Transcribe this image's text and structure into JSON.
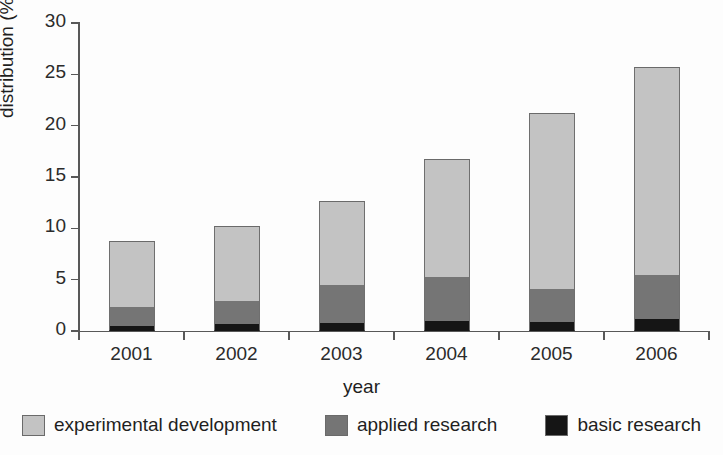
{
  "chart_data": {
    "type": "bar",
    "subtype": "stacked-bar",
    "title": "",
    "xlabel": "year",
    "ylabel": "distribution (%)",
    "categories": [
      "2001",
      "2002",
      "2003",
      "2004",
      "2005",
      "2006"
    ],
    "ylim": [
      0,
      30
    ],
    "yticks": [
      0,
      5,
      10,
      15,
      20,
      25,
      30
    ],
    "ytick_labels": [
      "0",
      "5",
      "10",
      "15",
      "20",
      "25",
      "30"
    ],
    "grid": false,
    "legend_position": "bottom",
    "stack_order_bottom_to_top": [
      "basic research",
      "applied research",
      "experimental development"
    ],
    "series": [
      {
        "name": "basic research",
        "color": "#151515",
        "values": [
          0.5,
          0.7,
          0.8,
          1.0,
          0.9,
          1.2
        ]
      },
      {
        "name": "applied research",
        "color": "#757575",
        "values": [
          1.8,
          2.2,
          3.7,
          4.3,
          3.2,
          4.3
        ]
      },
      {
        "name": "experimental development",
        "color": "#c3c3c3",
        "values": [
          6.5,
          7.3,
          8.2,
          11.5,
          17.1,
          20.2
        ]
      }
    ],
    "totals": [
      8.8,
      10.2,
      12.7,
      16.8,
      21.2,
      25.7
    ],
    "cumulative_tops": {
      "basic research": [
        0.5,
        0.7,
        0.8,
        1.0,
        0.9,
        1.2
      ],
      "applied research": [
        2.3,
        2.9,
        4.5,
        5.3,
        4.1,
        5.5
      ],
      "experimental development": [
        8.8,
        10.2,
        12.7,
        16.8,
        21.2,
        25.7
      ]
    }
  },
  "legend": {
    "items": [
      {
        "label": "experimental development",
        "color": "#c3c3c3"
      },
      {
        "label": "applied research",
        "color": "#757575"
      },
      {
        "label": "basic research",
        "color": "#151515"
      }
    ]
  }
}
